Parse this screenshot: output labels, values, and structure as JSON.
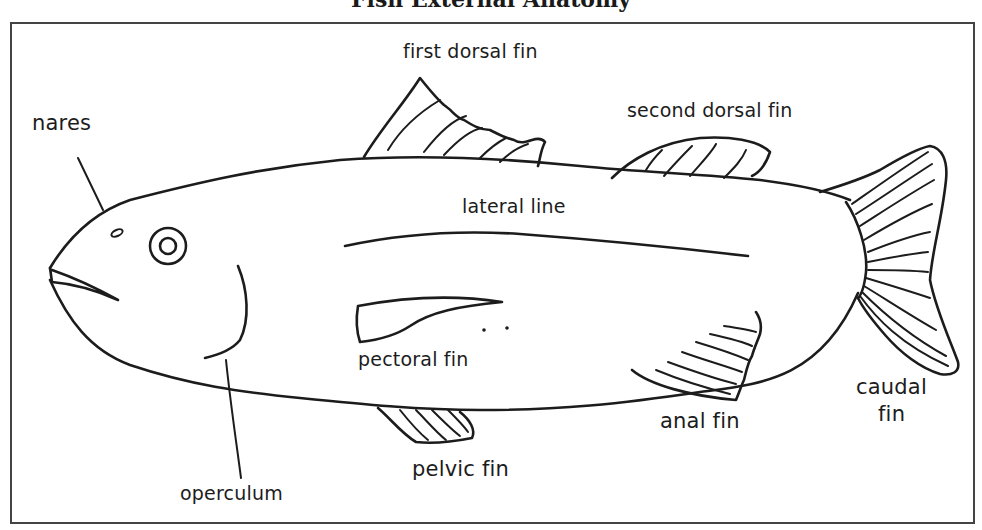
{
  "diagram": {
    "title": "Fish External Anatomy",
    "title_note": "title partially clipped at top edge; only lower portion of text visible",
    "subject": "fish",
    "style": "hand-drawn line art, black ink on white",
    "frame_color": "#444444",
    "ink_color": "#1c1c1c",
    "labels": {
      "first_dorsal_fin": "first dorsal fin",
      "second_dorsal_fin": "second dorsal fin",
      "nares": "nares",
      "lateral_line": "lateral line",
      "pectoral_fin": "pectoral fin",
      "operculum": "operculum",
      "pelvic_fin": "pelvic fin",
      "anal_fin": "anal fin",
      "caudal_fin_line1": "caudal",
      "caudal_fin_line2": "fin"
    },
    "parts": [
      "first dorsal fin",
      "second dorsal fin",
      "nares",
      "lateral line",
      "pectoral fin",
      "operculum",
      "pelvic fin",
      "anal fin",
      "caudal fin"
    ]
  }
}
